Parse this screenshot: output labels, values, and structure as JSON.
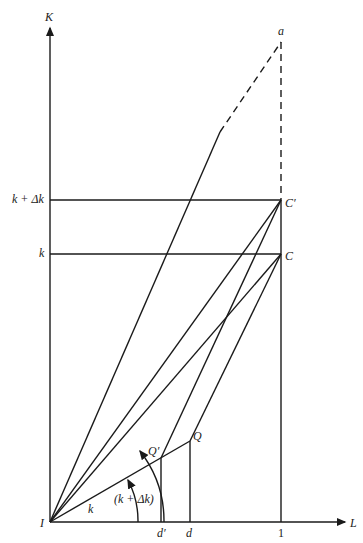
{
  "axes": {
    "y_label": "K",
    "x_label": "L",
    "origin_label": "I"
  },
  "y_ticks": [
    {
      "label": "k + Δk"
    },
    {
      "label": "k"
    }
  ],
  "x_ticks": [
    {
      "label": "d′"
    },
    {
      "label": "d"
    },
    {
      "label": "1"
    }
  ],
  "points": {
    "a": "a",
    "C_prime": "C′",
    "C": "C",
    "Q_prime": "Q′",
    "Q": "Q"
  },
  "angles": {
    "inner": "k",
    "outer": "(k + Δk)"
  },
  "colors": {
    "line": "#1a1a1a",
    "background": "#ffffff"
  }
}
